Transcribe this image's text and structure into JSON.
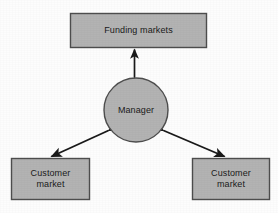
{
  "diagram": {
    "background_color": "#fdfdfd",
    "node_fill_color": "#b3b3b3",
    "node_stroke_color": "#4d4d4d",
    "connector_color": "#1a1a1a",
    "nodes": {
      "funding_markets": {
        "label": "Funding markets",
        "shape": "rectangle"
      },
      "manager": {
        "label": "Manager",
        "shape": "circle"
      },
      "customer_market_left": {
        "label": "Customer\nmarket",
        "shape": "rectangle"
      },
      "customer_market_right": {
        "label": "Customer\nmarket",
        "shape": "rectangle"
      }
    },
    "connectors": [
      {
        "name": "funding-to-manager",
        "from": "manager",
        "to": "funding_markets",
        "style": "double-arrow",
        "orientation": "vertical"
      },
      {
        "name": "manager-to-customer-left",
        "from": "manager",
        "to": "customer_market_left",
        "style": "double-arrow",
        "orientation": "diagonal-left"
      },
      {
        "name": "manager-to-customer-right",
        "from": "manager",
        "to": "customer_market_right",
        "style": "double-arrow",
        "orientation": "diagonal-right"
      }
    ]
  }
}
